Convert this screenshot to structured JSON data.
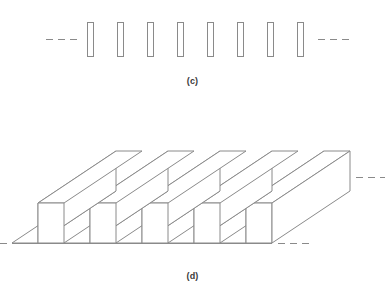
{
  "figure": {
    "background_color": "#ffffff",
    "line_color": "#8a8a8a",
    "label_color": "#3a3a3a",
    "width": 385,
    "height": 295
  },
  "panels": [
    {
      "id": "c",
      "label": "(c)",
      "caption_text": "(c)",
      "view": "cross-section",
      "description": "Two-dimensional cross-sectional profile of a periodic lamellar grating showing vertical rectangular lamellae",
      "element_count": 8,
      "element_shape": "rectangle",
      "lamella": {
        "width": 6,
        "height": 34,
        "pitch": 30,
        "first_center_x": 90,
        "top_y": 22,
        "bottom_y": 56
      },
      "continuation": {
        "left": "---",
        "right": "---",
        "dash_count": 3,
        "dash_length": 7,
        "dash_gap": 5,
        "left_x": 46,
        "right_x": 318,
        "y": 39
      }
    },
    {
      "id": "d",
      "label": "(d)",
      "caption_text": "(d)",
      "view": "isometric",
      "description": "Three-dimensional isometric view of the same periodic grating showing parallel ridges with rectangular grooves between them",
      "ridge_count": 5,
      "groove_count": 5,
      "geometry": {
        "ridge_top_width": 26,
        "groove_width": 26,
        "ridge_height": 40,
        "depth_dx": 78,
        "depth_dy": -52,
        "front_base_y": 243,
        "front_top_y": 203,
        "first_front_x": 38
      },
      "continuation": {
        "left_front": "---",
        "right_front": "---",
        "right_side": "---",
        "dash_count": 3,
        "dash_length": 7,
        "dash_gap": 5
      }
    }
  ]
}
